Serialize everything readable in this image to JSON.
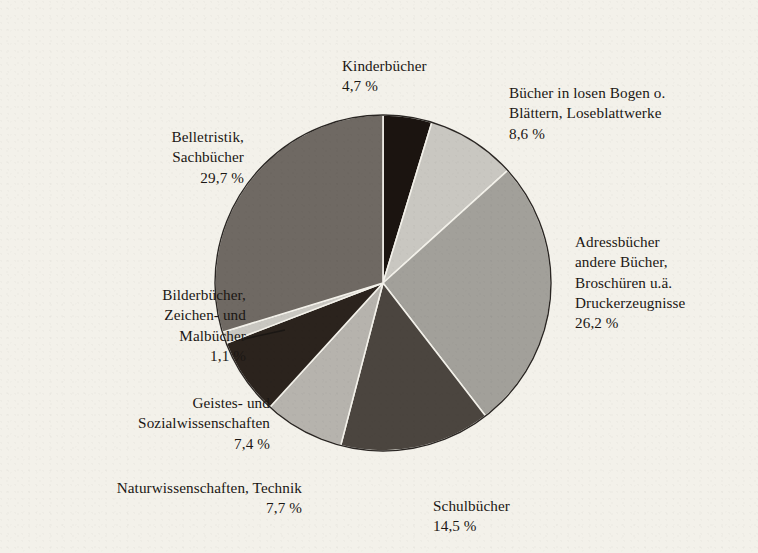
{
  "chart_data": {
    "type": "pie",
    "title": "",
    "subtitle": "",
    "xlabel": "",
    "ylabel": "",
    "legend_position": "none",
    "grid": false,
    "value_unit": "%",
    "decimal_separator": ",",
    "start_angle_deg": 0,
    "direction": "clockwise",
    "categories": [
      "Kinderbücher",
      "Bücher in losen Bogen o. Blättern, Loseblattwerke",
      "Adressbücher andere Bücher, Broschüren u.ä. Druckerzeugnisse",
      "Schulbücher",
      "Naturwissenschaften, Technik",
      "Geistes- und Sozialwissenschaften",
      "Bilderbücher, Zeichen- und Malbücher",
      "Belletristik, Sachbücher"
    ],
    "values": [
      4.7,
      8.6,
      26.2,
      14.5,
      7.7,
      7.4,
      1.1,
      29.7
    ],
    "colors": [
      "#1b1410",
      "#c9c7c1",
      "#a2a09a",
      "#4b453f",
      "#b6b3ad",
      "#2b231d",
      "#c9c7c1",
      "#6f6963"
    ],
    "slices": [
      {
        "id": "kinderbuecher",
        "name": "Kinderbücher",
        "label_lines": "Kinderbücher",
        "value": 4.7,
        "pct_text": "4,7 %",
        "color": "#1b1410"
      },
      {
        "id": "losebogen",
        "name": "Bücher in losen Bogen o. Blättern, Loseblattwerke",
        "label_lines": "Bücher in losen Bogen o.\nBlättern, Loseblattwerke",
        "value": 8.6,
        "pct_text": "8,6 %",
        "color": "#c9c7c1"
      },
      {
        "id": "adressbuecher",
        "name": "Adressbücher andere Bücher, Broschüren u.ä. Druckerzeugnisse",
        "label_lines": "Adressbücher\nandere Bücher,\nBroschüren u.ä.\nDruckerzeugnisse",
        "value": 26.2,
        "pct_text": "26,2 %",
        "color": "#a2a09a"
      },
      {
        "id": "schulbuecher",
        "name": "Schulbücher",
        "label_lines": "Schulbücher",
        "value": 14.5,
        "pct_text": "14,5 %",
        "color": "#4b453f"
      },
      {
        "id": "naturwissenschaften",
        "name": "Naturwissenschaften, Technik",
        "label_lines": "Naturwissenschaften, Technik",
        "value": 7.7,
        "pct_text": "7,7 %",
        "color": "#b6b3ad"
      },
      {
        "id": "geistes",
        "name": "Geistes- und Sozialwissenschaften",
        "label_lines": "Geistes- und\nSozialwissenschaften",
        "value": 7.4,
        "pct_text": "7,4 %",
        "color": "#2b231d"
      },
      {
        "id": "bilderbuecher",
        "name": "Bilderbücher, Zeichen- und Malbücher",
        "label_lines": "Bilderbücher,\nZeichen- und\nMalbücher",
        "value": 1.1,
        "pct_text": "1,1 %",
        "color": "#c9c7c1"
      },
      {
        "id": "belletristik",
        "name": "Belletristik, Sachbücher",
        "label_lines": "Belletristik,\nSachbücher",
        "value": 29.7,
        "pct_text": "29,7 %",
        "color": "#6f6963"
      }
    ]
  },
  "canvas": {
    "background_color": "#f3f1ea",
    "outline_color": "#2a2623",
    "leader_line_color": "#1b1714"
  }
}
